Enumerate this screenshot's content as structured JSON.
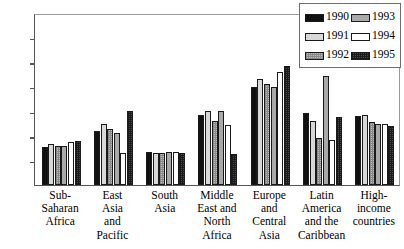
{
  "chart_data": {
    "type": "bar",
    "title": "",
    "subtitle": "",
    "xlabel": "",
    "ylabel": "",
    "ylim": [
      0,
      7
    ],
    "yticks": [
      0,
      1,
      2,
      3,
      4,
      5,
      6,
      7
    ],
    "ytick_labels": [
      "0",
      "1",
      "2",
      "3",
      "4",
      "5",
      "6",
      "7"
    ],
    "grid": false,
    "legend_position": "top-right",
    "categories": [
      "Sub-Saharan Africa",
      "East Asia and Pacific",
      "South Asia",
      "Middle East and North Africa",
      "Europe and Central Asia",
      "Latin America and the Caribbean",
      "High-income countries"
    ],
    "category_lines": [
      [
        "Sub-",
        "Saharan",
        "Africa"
      ],
      [
        "East",
        "Asia",
        "and",
        "Pacific"
      ],
      [
        "South",
        "Asia"
      ],
      [
        "Middle",
        "East and",
        "North",
        "Africa"
      ],
      [
        "Europe",
        "and",
        "Central",
        "Asia"
      ],
      [
        "Latin",
        "America",
        "and the",
        "Caribbean"
      ],
      [
        "High-",
        "income",
        "countries"
      ]
    ],
    "series": [
      {
        "name": "1990",
        "color": "#111111",
        "values": [
          1.55,
          2.2,
          1.35,
          2.85,
          4.0,
          2.95,
          2.8
        ]
      },
      {
        "name": "1991",
        "color": "#d8d8d8",
        "values": [
          1.65,
          2.5,
          1.3,
          3.0,
          4.3,
          2.6,
          2.85
        ]
      },
      {
        "name": "1992",
        "color": "#bdbdbd",
        "values": [
          1.6,
          2.3,
          1.3,
          2.6,
          4.1,
          1.9,
          2.55
        ]
      },
      {
        "name": "1993",
        "color": "#a9a9a9",
        "values": [
          1.6,
          2.1,
          1.35,
          3.0,
          4.0,
          4.45,
          2.5
        ]
      },
      {
        "name": "1994",
        "color": "#ffffff",
        "values": [
          1.75,
          1.3,
          1.35,
          2.45,
          4.6,
          1.85,
          2.5
        ]
      },
      {
        "name": "1995",
        "color": "#4a4a4a",
        "values": [
          1.8,
          3.0,
          1.3,
          1.25,
          4.85,
          2.75,
          2.4
        ]
      }
    ]
  },
  "legend": {
    "entries": [
      {
        "label": "1990",
        "swatch": "y1990"
      },
      {
        "label": "1991",
        "swatch": "y1991"
      },
      {
        "label": "1992",
        "swatch": "y1992"
      },
      {
        "label": "1993",
        "swatch": "y1993"
      },
      {
        "label": "1994",
        "swatch": "y1994"
      },
      {
        "label": "1995",
        "swatch": "y1995"
      }
    ]
  }
}
